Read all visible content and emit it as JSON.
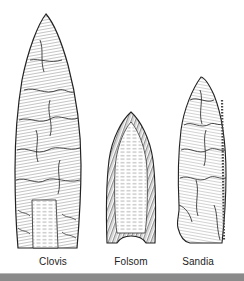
{
  "figure": {
    "points": [
      {
        "name": "Clovis",
        "label_x": 23
      },
      {
        "name": "Folsom",
        "label_x": 101
      },
      {
        "name": "Sandia",
        "label_x": 168
      }
    ],
    "colors": {
      "ink": "#2a2a2a",
      "paper": "#ffffff",
      "bottom_bar": "#8a8a8a"
    }
  }
}
